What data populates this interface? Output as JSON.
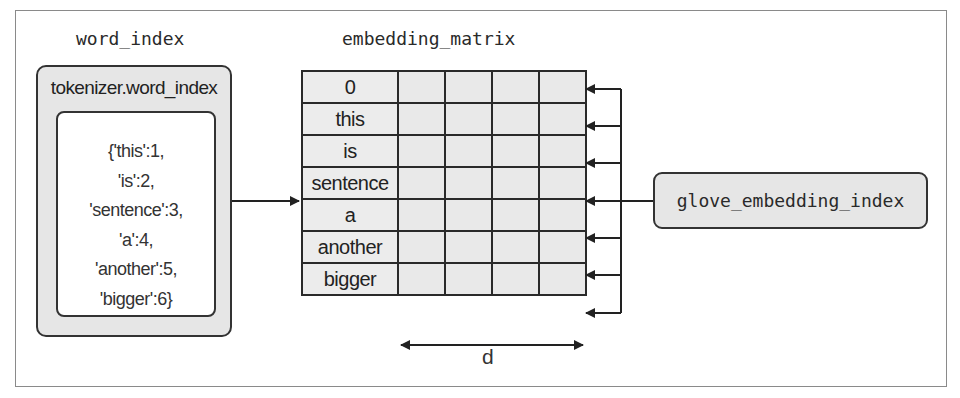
{
  "diagram": {
    "left_title": "word_index",
    "matrix_title": "embedding_matrix",
    "word_index_box": {
      "label": "tokenizer.word_index",
      "dict_lines": [
        "{'this':1,",
        "'is':2,",
        "'sentence':3,",
        "'a':4,",
        "'another':5,",
        "'bigger':6}"
      ]
    },
    "matrix": {
      "row_labels": [
        "0",
        "this",
        "is",
        "sentence",
        "a",
        "another",
        "bigger"
      ],
      "value_columns": 4,
      "dimension_label": "d"
    },
    "source_box": {
      "label": "glove_embedding_index"
    },
    "colors": {
      "box_fill": "#e6e6e6",
      "stroke": "#2a2a2a",
      "background": "#ffffff"
    }
  }
}
